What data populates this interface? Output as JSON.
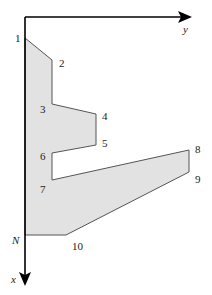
{
  "diagram": {
    "type": "polygon-cross-section",
    "colors": {
      "fill": "#e2e2e2",
      "outline": "#555555",
      "axis": "#000000",
      "text": "#222222"
    },
    "axes": {
      "origin": [
        25,
        17
      ],
      "y_axis": {
        "label": "y",
        "end": [
          190,
          17
        ],
        "direction": "right"
      },
      "x_axis": {
        "label": "x",
        "end": [
          25,
          283
        ],
        "direction": "down"
      }
    },
    "vertices": [
      {
        "id": "1",
        "label": "1",
        "x": 25,
        "y": 38
      },
      {
        "id": "2",
        "label": "2",
        "x": 52,
        "y": 60
      },
      {
        "id": "3",
        "label": "3",
        "x": 52,
        "y": 104
      },
      {
        "id": "4",
        "label": "4",
        "x": 96,
        "y": 114
      },
      {
        "id": "5",
        "label": "5",
        "x": 96,
        "y": 145
      },
      {
        "id": "6",
        "label": "6",
        "x": 52,
        "y": 153
      },
      {
        "id": "7",
        "label": "7",
        "x": 52,
        "y": 180
      },
      {
        "id": "8",
        "label": "8",
        "x": 189,
        "y": 150
      },
      {
        "id": "9",
        "label": "9",
        "x": 189,
        "y": 172
      },
      {
        "id": "10",
        "label": "10",
        "x": 66,
        "y": 235
      },
      {
        "id": "N",
        "label": "N",
        "x": 25,
        "y": 235
      }
    ],
    "labels": {
      "v1": "1",
      "v2": "2",
      "v3": "3",
      "v4": "4",
      "v5": "5",
      "v6": "6",
      "v7": "7",
      "v8": "8",
      "v9": "9",
      "v10": "10",
      "vN": "N",
      "axis_x": "x",
      "axis_y": "y"
    }
  }
}
